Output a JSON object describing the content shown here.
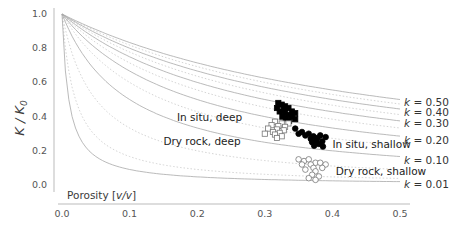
{
  "chart_data": {
    "type": "scatter",
    "title": "",
    "xlabel": "Porosity [v/v]",
    "ylabel": "K / K0",
    "xlim": [
      0.0,
      0.5
    ],
    "ylim": [
      0.0,
      1.0
    ],
    "xticks": [
      "0.0",
      "0.1",
      "0.2",
      "0.3",
      "0.4",
      "0.5"
    ],
    "yticks": [
      "0.0",
      "0.2",
      "0.4",
      "0.6",
      "0.8",
      "1.0"
    ],
    "grid": false,
    "model_curves": {
      "formula": "K/K0 = k/(k+phi)",
      "labeled_k": [
        0.5,
        0.4,
        0.3,
        0.2,
        0.1,
        0.01
      ],
      "labels": [
        "k = 0.50",
        "k = 0.40",
        "k = 0.30",
        "k = 0.20",
        "k = 0.10",
        "k = 0.01"
      ],
      "intermediate_k_dotted": [
        0.45,
        0.35,
        0.25,
        0.15,
        0.05,
        0.02
      ],
      "values_at_phi_0_5": [
        0.46,
        0.42,
        0.36,
        0.27,
        0.15,
        0.02
      ]
    },
    "series": [
      {
        "name": "In situ, deep",
        "marker": "filled-square",
        "color": "#000000",
        "points": [
          [
            0.32,
            0.48
          ],
          [
            0.325,
            0.47
          ],
          [
            0.33,
            0.46
          ],
          [
            0.318,
            0.45
          ],
          [
            0.335,
            0.45
          ],
          [
            0.328,
            0.44
          ],
          [
            0.34,
            0.43
          ],
          [
            0.322,
            0.43
          ],
          [
            0.33,
            0.42
          ],
          [
            0.345,
            0.42
          ],
          [
            0.336,
            0.41
          ],
          [
            0.326,
            0.4
          ],
          [
            0.34,
            0.4
          ],
          [
            0.331,
            0.39
          ],
          [
            0.345,
            0.385
          ],
          [
            0.336,
            0.375
          ]
        ]
      },
      {
        "name": "Dry rock, deep",
        "marker": "open-square",
        "color": "#555555",
        "points": [
          [
            0.315,
            0.37
          ],
          [
            0.325,
            0.36
          ],
          [
            0.335,
            0.36
          ],
          [
            0.31,
            0.35
          ],
          [
            0.32,
            0.345
          ],
          [
            0.33,
            0.34
          ],
          [
            0.305,
            0.33
          ],
          [
            0.318,
            0.325
          ],
          [
            0.328,
            0.32
          ],
          [
            0.312,
            0.31
          ],
          [
            0.322,
            0.305
          ],
          [
            0.3,
            0.3
          ],
          [
            0.315,
            0.295
          ],
          [
            0.325,
            0.285
          ],
          [
            0.318,
            0.275
          ]
        ]
      },
      {
        "name": "In situ, shallow",
        "marker": "filled-circle",
        "color": "#000000",
        "points": [
          [
            0.345,
            0.33
          ],
          [
            0.355,
            0.31
          ],
          [
            0.35,
            0.3
          ],
          [
            0.36,
            0.29
          ],
          [
            0.365,
            0.3
          ],
          [
            0.372,
            0.285
          ],
          [
            0.368,
            0.27
          ],
          [
            0.378,
            0.275
          ],
          [
            0.382,
            0.29
          ],
          [
            0.376,
            0.26
          ],
          [
            0.385,
            0.255
          ],
          [
            0.37,
            0.25
          ],
          [
            0.38,
            0.24
          ],
          [
            0.373,
            0.23
          ],
          [
            0.39,
            0.28
          ],
          [
            0.386,
            0.225
          ]
        ]
      },
      {
        "name": "Dry rock, shallow",
        "marker": "open-circle",
        "color": "#555555",
        "points": [
          [
            0.35,
            0.15
          ],
          [
            0.358,
            0.14
          ],
          [
            0.365,
            0.15
          ],
          [
            0.375,
            0.13
          ],
          [
            0.355,
            0.12
          ],
          [
            0.368,
            0.12
          ],
          [
            0.382,
            0.13
          ],
          [
            0.39,
            0.12
          ],
          [
            0.372,
            0.1
          ],
          [
            0.385,
            0.1
          ],
          [
            0.36,
            0.09
          ],
          [
            0.375,
            0.08
          ],
          [
            0.37,
            0.06
          ],
          [
            0.38,
            0.05
          ],
          [
            0.375,
            0.03
          ],
          [
            0.365,
            0.04
          ]
        ]
      }
    ],
    "annotations": [
      {
        "text": "In situ, deep",
        "x": 0.17,
        "y": 0.4
      },
      {
        "text": "Dry rock, deep",
        "x": 0.15,
        "y": 0.26
      },
      {
        "text": "In situ, shallow",
        "x": 0.4,
        "y": 0.24
      },
      {
        "text": "Dry rock, shallow",
        "x": 0.405,
        "y": 0.08
      }
    ]
  },
  "axes": {
    "ylabel_main": "K / K",
    "ylabel_sub": "0",
    "xlabel_main": "Porosity [",
    "xlabel_unit": "v/v",
    "xlabel_end": "]"
  }
}
